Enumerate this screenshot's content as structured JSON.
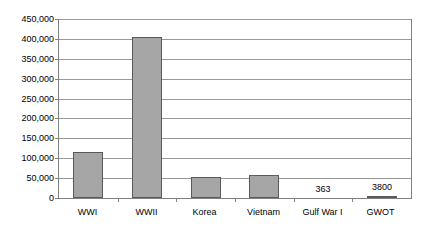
{
  "chart_data": {
    "type": "bar",
    "title": "",
    "subtitle": "",
    "xlabel": "",
    "ylabel": "",
    "categories": [
      "WWI",
      "WWII",
      "Korea",
      "Vietnam",
      "Gulf War I",
      "GWOT"
    ],
    "values": [
      116000,
      405000,
      52000,
      57000,
      363,
      3800
    ],
    "point_labels": [
      "",
      "",
      "",
      "",
      "363",
      "3800"
    ],
    "ylim": [
      0,
      450000
    ],
    "ytick_values": [
      0,
      50000,
      100000,
      150000,
      200000,
      250000,
      300000,
      350000,
      400000,
      450000
    ],
    "ytick_labels": [
      "0",
      "50,000",
      "100,000",
      "150,000",
      "200,000",
      "250,000",
      "300,000",
      "350,000",
      "400,000",
      "450,000"
    ],
    "grid": true,
    "legend": false,
    "legend_position": "none",
    "bar_color": "#a6a6a6",
    "bar_border_color": "#5a5a5a",
    "gridline_color": "#999999",
    "axis_color": "#808080",
    "background_color": "#ffffff"
  }
}
